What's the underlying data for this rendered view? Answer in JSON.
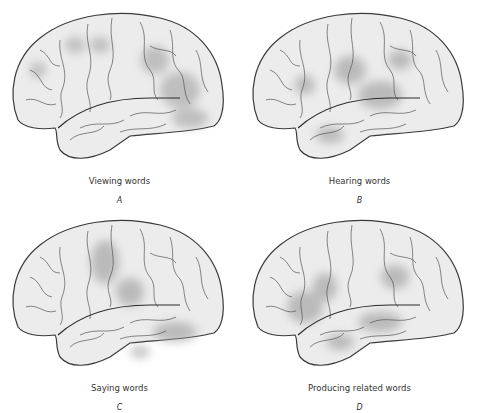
{
  "figure": {
    "panels": [
      {
        "id": "A",
        "caption": "Viewing words",
        "letter": "A"
      },
      {
        "id": "B",
        "caption": "Hearing words",
        "letter": "B"
      },
      {
        "id": "C",
        "caption": "Saying words",
        "letter": "C"
      },
      {
        "id": "D",
        "caption": "Producing related words",
        "letter": "D"
      }
    ],
    "colors": {
      "brain_fill": "#ececec",
      "outline": "#3a3a3a",
      "activation": "#9a9a9a",
      "text": "#333333"
    }
  }
}
